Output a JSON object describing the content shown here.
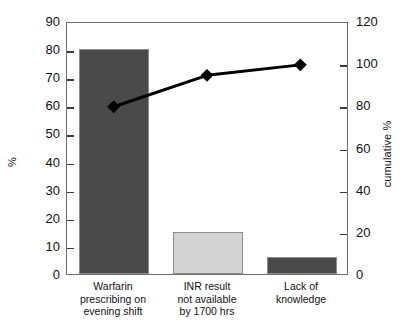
{
  "chart_data": {
    "type": "bar",
    "title": "",
    "subtitle": "",
    "categories": [
      "Warfarin prescribing on evening shift",
      "INR result not available by 1700 hrs",
      "Lack of knowledge"
    ],
    "category_lines": [
      [
        "Warfarin",
        "prescribing on",
        "evening shift"
      ],
      [
        "INR result",
        "not available",
        "by 1700 hrs"
      ],
      [
        "Lack of",
        "knowledge"
      ]
    ],
    "series": [
      {
        "name": "frequency",
        "kind": "bar",
        "axis": "left",
        "values": [
          80,
          15,
          6
        ],
        "colors": [
          "#4a4a4a",
          "#d3d3d3",
          "#4a4a4a"
        ]
      },
      {
        "name": "cumulative %",
        "kind": "line",
        "axis": "right",
        "values": [
          80,
          95,
          100
        ],
        "color": "#000000",
        "marker": "diamond"
      }
    ],
    "xlabel": "",
    "ylabel": "%",
    "y2label": "cumulative %",
    "ylim": [
      0,
      90
    ],
    "y2lim": [
      0,
      120
    ],
    "yticks": [
      0,
      10,
      20,
      30,
      40,
      50,
      60,
      70,
      80,
      90
    ],
    "y2ticks": [
      0,
      20,
      40,
      60,
      80,
      100,
      120
    ],
    "grid": false,
    "legend": "none"
  },
  "axes": {
    "left": {
      "label": "%",
      "ticks": [
        "0",
        "10",
        "20",
        "30",
        "40",
        "50",
        "60",
        "70",
        "80",
        "90"
      ]
    },
    "right": {
      "label": "cumulative %",
      "ticks": [
        "0",
        "20",
        "40",
        "60",
        "80",
        "100",
        "120"
      ]
    }
  },
  "footer": {
    "clipped_caption": ""
  },
  "colors": {
    "bar_dark": "#4a4a4a",
    "bar_light": "#d3d3d3",
    "line": "#000000",
    "frame": "#6e6e6e",
    "text": "#111111"
  }
}
